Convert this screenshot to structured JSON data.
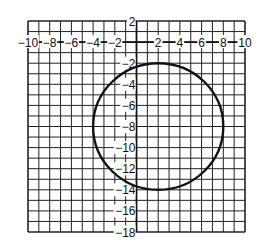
{
  "graph": {
    "title": "",
    "x_range": [
      -10,
      10
    ],
    "y_range": [
      -18,
      2
    ],
    "grid_step": 1,
    "x_tick_labels": [
      "-10",
      "-8",
      "-6",
      "-4",
      "-2",
      "2",
      "4",
      "6",
      "8",
      "10"
    ],
    "y_tick_labels": [
      "2",
      "-2",
      "-4",
      "-6",
      "-8",
      "-10",
      "-12",
      "-14",
      "-16",
      "-18"
    ],
    "colors": {
      "grid": "#222222",
      "axis": "#111111",
      "curve": "#111111",
      "background": "#ffffff"
    }
  },
  "chart_data": {
    "type": "scatter",
    "title": "",
    "xlabel": "",
    "ylabel": "",
    "xlim": [
      -10,
      10
    ],
    "ylim": [
      -18,
      2
    ],
    "grid": true,
    "x_ticks": [
      -10,
      -8,
      -6,
      -4,
      -2,
      2,
      4,
      6,
      8,
      10
    ],
    "y_ticks": [
      2,
      -2,
      -4,
      -6,
      -8,
      -10,
      -12,
      -14,
      -16,
      -18
    ],
    "shapes": [
      {
        "kind": "circle",
        "center": [
          2,
          -8
        ],
        "radius": 6,
        "equation": "(x-2)^2 + (y+8)^2 = 36"
      }
    ],
    "key_points": {
      "top": [
        2,
        -2
      ],
      "bottom": [
        2,
        -14
      ],
      "left": [
        -4,
        -8
      ],
      "right": [
        8,
        -8
      ]
    }
  }
}
